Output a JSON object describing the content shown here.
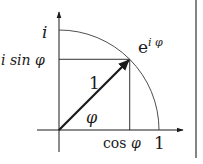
{
  "diagram": {
    "labels": {
      "imag_axis": "i",
      "imag_component_prefix": "i sin ",
      "imag_component_var": "φ",
      "point_base": "e",
      "point_exp": "i φ",
      "radius": "1",
      "angle": "φ",
      "real_component_prefix": "cos ",
      "real_component_var": "φ",
      "real_unit": "1"
    },
    "angle_degrees": 45,
    "radius_value": 1,
    "colors": {
      "ink": "#1a1a1a",
      "arc": "#3a3a3a",
      "background": "#ffffff"
    }
  }
}
